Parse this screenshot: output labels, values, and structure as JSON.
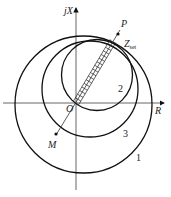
{
  "diagram": {
    "axes": {
      "vertical_label": "jX",
      "horizontal_label": "R",
      "origin_label": "O"
    },
    "points": {
      "P": "P",
      "M": "M"
    },
    "setting_label": {
      "main": "Z",
      "subscript": "set"
    },
    "circle_labels": [
      "1",
      "2",
      "3"
    ],
    "colors": {
      "stroke": "#111111",
      "background": "#ffffff"
    }
  }
}
